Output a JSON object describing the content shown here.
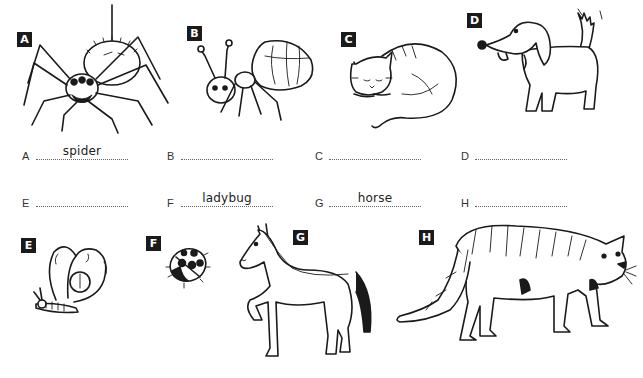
{
  "worksheet": {
    "pictures": [
      {
        "letter": "A",
        "animal_depicted": "spider"
      },
      {
        "letter": "B",
        "animal_depicted": "ant"
      },
      {
        "letter": "C",
        "animal_depicted": "cat"
      },
      {
        "letter": "D",
        "animal_depicted": "dog"
      },
      {
        "letter": "E",
        "animal_depicted": "butterfly"
      },
      {
        "letter": "F",
        "animal_depicted": "ladybug"
      },
      {
        "letter": "G",
        "animal_depicted": "horse"
      },
      {
        "letter": "H",
        "animal_depicted": "tiger"
      }
    ],
    "answers": [
      {
        "letter": "A",
        "value": "spider"
      },
      {
        "letter": "B",
        "value": ""
      },
      {
        "letter": "C",
        "value": ""
      },
      {
        "letter": "D",
        "value": ""
      },
      {
        "letter": "E",
        "value": ""
      },
      {
        "letter": "F",
        "value": "ladybug"
      },
      {
        "letter": "G",
        "value": "horse"
      },
      {
        "letter": "H",
        "value": ""
      }
    ]
  }
}
